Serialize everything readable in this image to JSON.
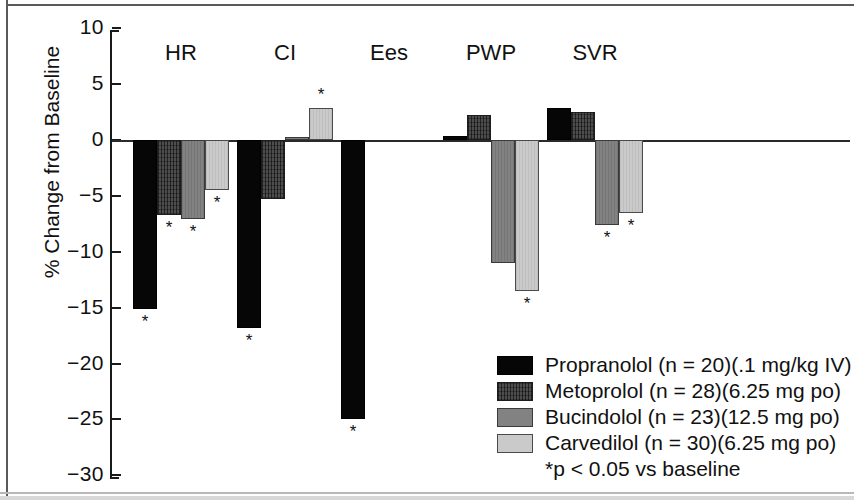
{
  "chart_data": {
    "type": "bar",
    "title": "",
    "xlabel": "",
    "ylabel": "% Change from Baseline",
    "ylim": [
      -30,
      10
    ],
    "ytick_labels": [
      "10",
      "5",
      "0",
      "−5",
      "−10",
      "−15",
      "−20",
      "−25",
      "−30"
    ],
    "ytick_values": [
      10,
      5,
      0,
      -5,
      -10,
      -15,
      -20,
      -25,
      -30
    ],
    "grid": false,
    "legend_position": "bottom-right",
    "categories": [
      "HR",
      "CI",
      "Ees",
      "PWP",
      "SVR"
    ],
    "series": [
      {
        "name": "Propranolol (n = 20)(.1 mg/kg IV)",
        "short_name": "Propranolol",
        "n": 20,
        "dose": ".1 mg/kg IV",
        "color": "#060606",
        "values": [
          -15.1,
          -16.8,
          -25.0,
          0.4,
          2.9
        ],
        "significant": [
          true,
          true,
          true,
          false,
          false
        ]
      },
      {
        "name": "Metoprolol (n = 28)(6.25 mg po)",
        "short_name": "Metoprolol",
        "n": 28,
        "dose": "6.25 mg po",
        "color": "#4d4d4d",
        "values": [
          -6.7,
          -5.3,
          null,
          2.2,
          2.5
        ],
        "significant": [
          true,
          false,
          false,
          false,
          false
        ]
      },
      {
        "name": "Bucindolol (n = 23)(12.5 mg po)",
        "short_name": "Bucindolol",
        "n": 23,
        "dose": "12.5 mg po",
        "color": "#828282",
        "values": [
          -7.1,
          0.3,
          null,
          -11.0,
          -7.6
        ],
        "significant": [
          true,
          false,
          false,
          false,
          true
        ]
      },
      {
        "name": "Carvedilol (n = 30)(6.25 mg po)",
        "short_name": "Carvedilol",
        "n": 30,
        "dose": "6.25 mg po",
        "color": "#cacaca",
        "values": [
          -4.5,
          2.9,
          null,
          -13.5,
          -6.5
        ],
        "significant": [
          true,
          true,
          false,
          true,
          true
        ]
      }
    ],
    "footnote": "*p < 0.05 vs baseline",
    "significance_marker": "*"
  },
  "legend": {
    "rows": [
      {
        "label": "Propranolol (n = 20)(.1 mg/kg IV)"
      },
      {
        "label": "Metoprolol (n = 28)(6.25 mg po)"
      },
      {
        "label": "Bucindolol (n = 23)(12.5 mg po)"
      },
      {
        "label": "Carvedilol (n = 30)(6.25 mg po)"
      }
    ],
    "note": "*p < 0.05 vs baseline"
  }
}
